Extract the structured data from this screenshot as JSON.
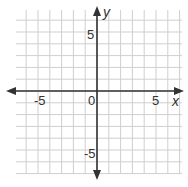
{
  "chart_data": {
    "type": "coordinate-plane",
    "title": "",
    "xlabel": "x",
    "ylabel": "y",
    "xlim": [
      -7,
      7
    ],
    "ylim": [
      -7,
      7
    ],
    "grid": true,
    "grid_step": 1,
    "tick_labels": {
      "x": [
        {
          "value": -5,
          "label": "-5"
        },
        {
          "value": 5,
          "label": "5"
        }
      ],
      "y": [
        {
          "value": 5,
          "label": "5"
        },
        {
          "value": -5,
          "label": "-5"
        }
      ],
      "origin": "0"
    },
    "axes_arrows": true,
    "series": []
  },
  "labels": {
    "x_axis": "x",
    "y_axis": "y",
    "origin": "0",
    "x_neg5": "-5",
    "x_pos5": "5",
    "y_pos5": "5",
    "y_neg5": "-5"
  },
  "colors": {
    "grid": "#c8c8c8",
    "axis": "#333333",
    "background": "#ffffff"
  }
}
